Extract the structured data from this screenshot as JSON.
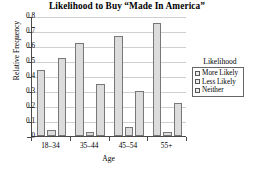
{
  "chart_data": {
    "type": "bar",
    "title": "Likelihood to Buy “Made In America”",
    "xlabel": "Age",
    "ylabel": "Relative Frequency",
    "categories": [
      "18–34",
      "35–44",
      "45–54",
      "55+"
    ],
    "series": [
      {
        "name": "More Likely",
        "values": [
          0.44,
          0.62,
          0.67,
          0.755
        ]
      },
      {
        "name": "Less Likely",
        "values": [
          0.04,
          0.03,
          0.06,
          0.03
        ]
      },
      {
        "name": "Neither",
        "values": [
          0.52,
          0.345,
          0.3,
          0.22
        ]
      }
    ],
    "ylim": [
      0,
      0.8
    ],
    "yticks": [
      "0",
      "0.1",
      "0.2",
      "0.3",
      "0.4",
      "0.5",
      "0.6",
      "0.7",
      "0.8"
    ],
    "grid": true,
    "legend_position": "right",
    "legend_title": "Likelihood",
    "bar_fill": "#dcdcdc",
    "bar_border": "#777777",
    "grid_color": "#cfcfcf",
    "axis_color": "#4a4a4a"
  }
}
